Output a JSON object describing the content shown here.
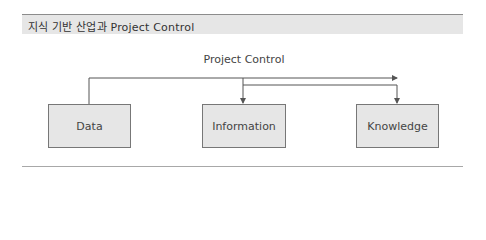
{
  "header": {
    "title": "지식 기반 산업과 Project Control"
  },
  "diagram": {
    "label": "Project Control",
    "nodes": [
      {
        "id": "data",
        "label": "Data"
      },
      {
        "id": "information",
        "label": "Information"
      },
      {
        "id": "knowledge",
        "label": "Knowledge"
      }
    ],
    "edges": [
      {
        "from": "data",
        "to": "beyond-knowledge",
        "via": "top line"
      },
      {
        "from": "top line",
        "to": "information"
      },
      {
        "from": "information-branch",
        "to": "knowledge"
      }
    ],
    "colors": {
      "box_fill": "#e6e6e6",
      "box_border": "#777777",
      "line": "#555555",
      "header_bg": "#e6e6e6"
    }
  }
}
